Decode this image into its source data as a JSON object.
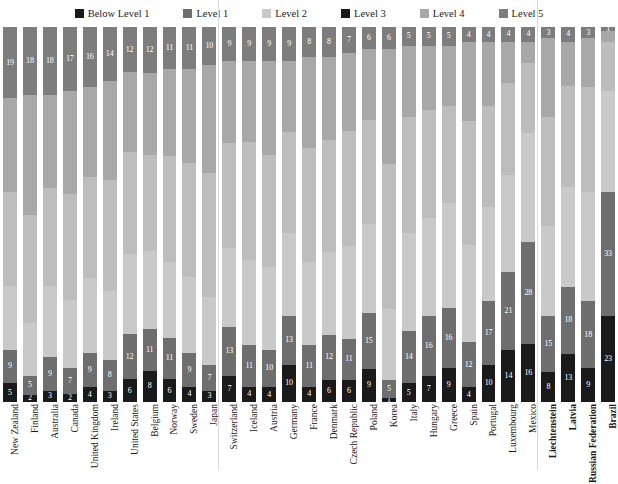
{
  "legend": {
    "items": [
      {
        "label": "Below Level 1",
        "color": "#1a1a1a"
      },
      {
        "label": "Level 1",
        "color": "#6e6e6e"
      },
      {
        "label": "Level 2",
        "color": "#c9c9c9"
      },
      {
        "label": "Level 3",
        "color": "#1a1a1a"
      },
      {
        "label": "Level 4",
        "color": "#a8a8a8"
      },
      {
        "label": "Level 5",
        "color": "#7d7d7d"
      }
    ]
  },
  "chart_data": {
    "type": "bar",
    "subtype": "stacked-percentage-column",
    "title": "",
    "subtitle": "",
    "xlabel": "",
    "ylabel": "",
    "ylim": [
      0,
      100
    ],
    "grid": false,
    "legend_position": "top",
    "stack_order_bottom_to_top": [
      "Below Level 1",
      "Level 1",
      "Level 2",
      "Level 3",
      "Level 4",
      "Level 5"
    ],
    "series_colors": {
      "Below Level 1": "#1a1a1a",
      "Level 1": "#6e6e6e",
      "Level 2": "#c9c9c9",
      "Level 3": "#bdbdbd",
      "Level 4": "#a8a8a8",
      "Level 5": "#7d7d7d"
    },
    "categories": [
      "New Zealand",
      "Finland",
      "Australia",
      "Canada",
      "United Kingdom",
      "Ireland",
      "United States",
      "Belgium",
      "Norway",
      "Sweden",
      "Japan",
      "Switzerland",
      "Iceland",
      "Austria",
      "Germany",
      "France",
      "Denmark",
      "Czech Republic",
      "Poland",
      "Korea",
      "Italy",
      "Hungary",
      "Greece",
      "Spain",
      "Portugal",
      "Luxembourg",
      "Mexico",
      "Liechtenstein",
      "Latvia",
      "Russian Federation",
      "Brazil"
    ],
    "series": [
      {
        "name": "Below Level 1",
        "values": [
          5,
          2,
          3,
          2,
          4,
          3,
          6,
          8,
          6,
          4,
          3,
          7,
          4,
          4,
          10,
          4,
          6,
          6,
          9,
          1,
          5,
          7,
          9,
          4,
          10,
          14,
          16,
          8,
          13,
          9,
          23
        ]
      },
      {
        "name": "Level 1",
        "values": [
          9,
          5,
          9,
          7,
          9,
          8,
          12,
          11,
          11,
          9,
          7,
          13,
          11,
          10,
          13,
          11,
          12,
          11,
          15,
          5,
          14,
          16,
          16,
          12,
          17,
          21,
          28,
          15,
          18,
          18,
          33
        ]
      },
      {
        "name": "Level 2",
        "values": [
          17,
          14,
          19,
          18,
          20,
          18,
          21,
          20,
          20,
          20,
          18,
          21,
          22,
          22,
          22,
          22,
          22,
          25,
          24,
          19,
          26,
          26,
          28,
          26,
          25,
          26,
          30,
          24,
          27,
          29,
          27
        ]
      },
      {
        "name": "Level 3",
        "values": [
          25,
          29,
          26,
          28,
          27,
          29,
          27,
          25,
          28,
          30,
          33,
          28,
          31,
          30,
          27,
          30,
          30,
          31,
          28,
          39,
          31,
          29,
          26,
          33,
          27,
          25,
          19,
          29,
          27,
          28,
          13
        ]
      },
      {
        "name": "Level 4",
        "values": [
          25,
          32,
          25,
          27,
          24,
          26,
          21,
          21,
          23,
          25,
          29,
          22,
          21,
          25,
          19,
          24,
          22,
          21,
          19,
          31,
          19,
          17,
          16,
          21,
          17,
          11,
          6,
          21,
          12,
          13,
          3
        ]
      },
      {
        "name": "Level 5",
        "values": [
          19,
          18,
          18,
          17,
          16,
          14,
          12,
          12,
          11,
          11,
          10,
          9,
          9,
          9,
          9,
          8,
          8,
          7,
          6,
          6,
          5,
          5,
          5,
          4,
          4,
          4,
          4,
          3,
          4,
          3,
          1
        ]
      }
    ],
    "labeled_values": {
      "Level 5": [
        19,
        18,
        18,
        17,
        16,
        14,
        12,
        12,
        11,
        11,
        10,
        9,
        9,
        9,
        9,
        8,
        8,
        7,
        6,
        6,
        5,
        5,
        5,
        4,
        4,
        4,
        4,
        3,
        4,
        3,
        1
      ],
      "Level 1": [
        9,
        5,
        9,
        7,
        9,
        8,
        12,
        11,
        11,
        9,
        7,
        13,
        11,
        10,
        13,
        11,
        12,
        11,
        15,
        5,
        14,
        16,
        16,
        12,
        17,
        21,
        28,
        15,
        18,
        18,
        33
      ],
      "Below Level 1": [
        5,
        2,
        3,
        2,
        4,
        3,
        6,
        8,
        6,
        4,
        3,
        7,
        4,
        4,
        10,
        4,
        6,
        6,
        9,
        1,
        5,
        7,
        9,
        4,
        10,
        14,
        16,
        8,
        13,
        9,
        23
      ]
    }
  },
  "xaxis": {
    "labels": [
      {
        "text": "New Zealand",
        "bold": false
      },
      {
        "text": "Finland",
        "bold": false
      },
      {
        "text": "Australia",
        "bold": false
      },
      {
        "text": "Canada",
        "bold": false
      },
      {
        "text": "United Kingdom",
        "bold": false
      },
      {
        "text": "Ireland",
        "bold": false
      },
      {
        "text": "United States",
        "bold": false
      },
      {
        "text": "Belgium",
        "bold": false
      },
      {
        "text": "Norway",
        "bold": false
      },
      {
        "text": "Sweden",
        "bold": false
      },
      {
        "text": "Japan",
        "bold": false
      },
      {
        "text": "Switzerland",
        "bold": false
      },
      {
        "text": "Iceland",
        "bold": false
      },
      {
        "text": "Austria",
        "bold": false
      },
      {
        "text": "Germany",
        "bold": false
      },
      {
        "text": "France",
        "bold": false
      },
      {
        "text": "Denmark",
        "bold": false
      },
      {
        "text": "Czech Republic",
        "bold": false
      },
      {
        "text": "Poland",
        "bold": false
      },
      {
        "text": "Korea",
        "bold": false
      },
      {
        "text": "Italy",
        "bold": false
      },
      {
        "text": "Hungary",
        "bold": false
      },
      {
        "text": "Greece",
        "bold": false
      },
      {
        "text": "Spain",
        "bold": false
      },
      {
        "text": "Portugal",
        "bold": false
      },
      {
        "text": "Luxembourg",
        "bold": false
      },
      {
        "text": "Mexico",
        "bold": false
      },
      {
        "text": "Liechtenstein",
        "bold": true
      },
      {
        "text": "Latvia",
        "bold": true
      },
      {
        "text": "Russian Federation",
        "bold": true
      },
      {
        "text": "Brazil",
        "bold": true
      }
    ]
  }
}
